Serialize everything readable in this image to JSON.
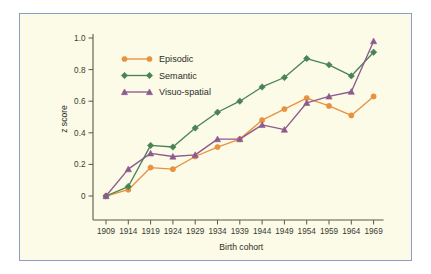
{
  "figure": {
    "background_color": "#fbfbe7",
    "border_color": "#8c9dc4",
    "page_color": "#ffffff"
  },
  "chart_data": {
    "type": "line",
    "title": "",
    "xlabel": "Birth cohort",
    "ylabel": "z score",
    "categories": [
      "1909",
      "1914",
      "1919",
      "1924",
      "1929",
      "1934",
      "1939",
      "1944",
      "1949",
      "1954",
      "1959",
      "1964",
      "1969"
    ],
    "ylim": [
      -0.1,
      1.0
    ],
    "yticks": [
      "0",
      "0.2",
      "0.4",
      "0.6",
      "0.8",
      "1.0"
    ],
    "ytick_values": [
      0,
      0.2,
      0.4,
      0.6,
      0.8,
      1.0
    ],
    "grid": false,
    "legend_position": "upper left",
    "series": [
      {
        "name": "Episodic",
        "color": "#e8913f",
        "marker": "circle",
        "values": [
          0.0,
          0.04,
          0.18,
          0.17,
          0.25,
          0.31,
          0.36,
          0.48,
          0.55,
          0.62,
          0.57,
          0.51,
          0.63
        ]
      },
      {
        "name": "Semantic",
        "color": "#4a8455",
        "marker": "diamond",
        "values": [
          0.0,
          0.06,
          0.32,
          0.31,
          0.43,
          0.53,
          0.6,
          0.69,
          0.75,
          0.87,
          0.83,
          0.76,
          0.91
        ]
      },
      {
        "name": "Visuo-spatial",
        "color": "#8e5a8e",
        "marker": "triangle",
        "values": [
          0.0,
          0.17,
          0.27,
          0.25,
          0.26,
          0.36,
          0.36,
          0.45,
          0.42,
          0.59,
          0.63,
          0.66,
          0.98
        ]
      }
    ]
  }
}
